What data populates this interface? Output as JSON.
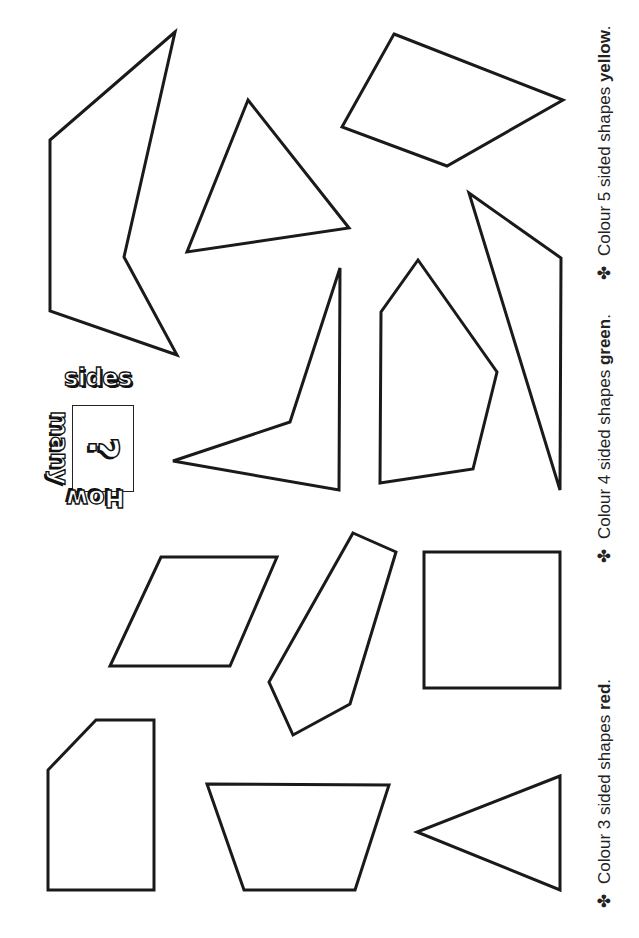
{
  "title": {
    "word1": "How",
    "word2": "many",
    "symbol": "?",
    "word3": "sides"
  },
  "instructions": [
    {
      "bullet": "✤",
      "prefix": "Colour 3 sided shapes ",
      "color_word": "red",
      "suffix": ".",
      "color": "#d32f2f"
    },
    {
      "bullet": "✤",
      "prefix": "Colour 4 sided shapes ",
      "color_word": "green",
      "suffix": ".",
      "color": "#2e7d32"
    },
    {
      "bullet": "✤",
      "prefix": "Colour 5 sided shapes ",
      "color_word": "yellow",
      "suffix": ".",
      "color": "#f9d71c"
    }
  ],
  "shapes": [
    {
      "name": "pentagon-concave-left",
      "sides": 5,
      "points": "175,32 50,140 50,311 177,355 124,257"
    },
    {
      "name": "triangle-upper",
      "sides": 3,
      "points": "248,100 187,252 349,228"
    },
    {
      "name": "quadrilateral-top-right",
      "sides": 4,
      "points": "394,34 563,100 447,166 342,127"
    },
    {
      "name": "triangle-long-right",
      "sides": 3,
      "points": "469,193 561,258 560,490"
    },
    {
      "name": "pentagon-house",
      "sides": 5,
      "points": "418,260 381,312 380,483 473,469 497,372"
    },
    {
      "name": "quadrilateral-concave",
      "sides": 4,
      "points": "340,268 290,422 173,461 339,490"
    },
    {
      "name": "parallelogram",
      "sides": 4,
      "points": "161,557 277,557 230,666 110,666"
    },
    {
      "name": "pentagon-tilted",
      "sides": 5,
      "points": "353,533 396,552 350,704 293,735 269,682"
    },
    {
      "name": "square",
      "sides": 4,
      "points": "424,552 560,552 560,688 424,688"
    },
    {
      "name": "pentagon-cut-corner",
      "sides": 5,
      "points": "96,720 154,720 154,890 48,890 48,770"
    },
    {
      "name": "trapezoid",
      "sides": 4,
      "points": "207,784 389,785 355,890 244,890"
    },
    {
      "name": "triangle-lower",
      "sides": 3,
      "points": "560,776 417,832 560,890"
    }
  ]
}
